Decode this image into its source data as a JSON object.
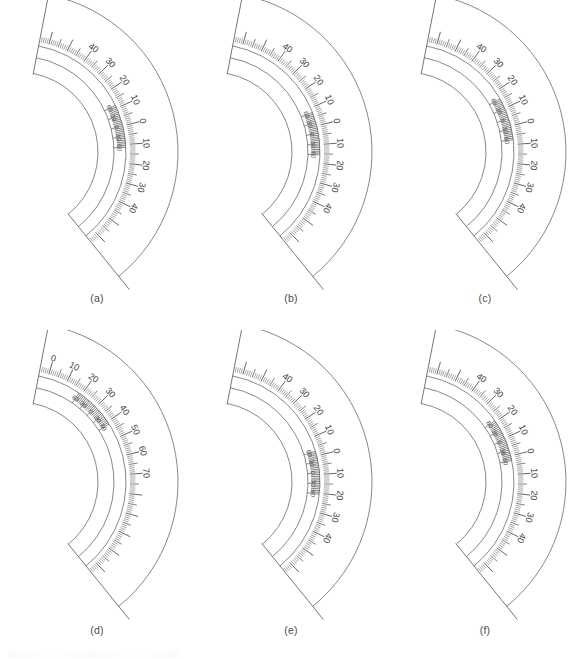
{
  "figure": {
    "background_color": "#ffffff",
    "line_color": "#5d5d5d",
    "text_color": "#3f3f3f",
    "panel_count": 6
  },
  "geometry": {
    "apex_x": 18,
    "apex_y": 152,
    "start_angle_deg": -79,
    "end_angle_deg": 51,
    "radius_inner_face": 80,
    "radius_vernier_inner": 96,
    "radius_vernier_outer": 108,
    "radius_main_scale": 112,
    "radius_outer_edge": 160,
    "tick_major_len": 13,
    "tick_mid_len": 9,
    "tick_minor_len": 5.5,
    "label_radius": 128,
    "vernier_label_radius": 101
  },
  "main_scale": {
    "unit": "degrees",
    "minor_step_deg": 1,
    "mid_step_deg": 5,
    "major_step_deg": 10
  },
  "vernier_scale": {
    "labels": [
      "60",
      "30",
      "0",
      "30",
      "60"
    ],
    "label_values": [
      60,
      30,
      0,
      30,
      60
    ],
    "unit": "minutes",
    "span_deg": 23,
    "division_count": 24
  },
  "panels": [
    {
      "id": "a",
      "caption": "(a)",
      "main_scale_labels": [
        "40",
        "30",
        "20",
        "10",
        "0",
        "10",
        "20",
        "30",
        "40"
      ],
      "main_scale_values": [
        40,
        30,
        20,
        10,
        0,
        10,
        20,
        30,
        40
      ],
      "main_scale_zero_angle_deg": -14,
      "vernier_center_angle_deg": 0.0,
      "vernier_labels": [
        "60",
        "30",
        "0",
        "30",
        "60"
      ],
      "reading_deg": 0.0
    },
    {
      "id": "b",
      "caption": "(b)",
      "main_scale_labels": [
        "40",
        "30",
        "20",
        "10",
        "0",
        "10",
        "20",
        "30",
        "40"
      ],
      "main_scale_values": [
        40,
        30,
        20,
        10,
        0,
        10,
        20,
        30,
        40
      ],
      "main_scale_zero_angle_deg": -14,
      "vernier_center_angle_deg": 4.0,
      "vernier_labels": [
        "60",
        "30",
        "0",
        "30",
        "60"
      ],
      "reading_deg": 4.0
    },
    {
      "id": "c",
      "caption": "(c)",
      "main_scale_labels": [
        "40",
        "30",
        "20",
        "10",
        "0",
        "10",
        "20",
        "30",
        "40"
      ],
      "main_scale_values": [
        40,
        30,
        20,
        10,
        0,
        10,
        20,
        30,
        40
      ],
      "main_scale_zero_angle_deg": -14,
      "vernier_center_angle_deg": -4.0,
      "vernier_labels": [
        "60",
        "30",
        "0",
        "30",
        "60"
      ],
      "reading_deg": -4.0
    },
    {
      "id": "d",
      "caption": "(d)",
      "main_scale_labels": [
        "10",
        "0",
        "10",
        "20",
        "30",
        "40",
        "50",
        "60",
        "70"
      ],
      "main_scale_values": [
        10,
        0,
        10,
        20,
        30,
        40,
        50,
        60,
        70
      ],
      "main_scale_zero_angle_deg": -44,
      "vernier_center_angle_deg": 0.0,
      "vernier_labels": [
        "60",
        "30",
        "0",
        "30",
        "60"
      ],
      "reading_deg": 30.0
    },
    {
      "id": "e",
      "caption": "(e)",
      "main_scale_labels": [
        "40",
        "30",
        "20",
        "10",
        "0",
        "10",
        "20",
        "30",
        "40"
      ],
      "main_scale_values": [
        40,
        30,
        20,
        10,
        0,
        10,
        20,
        30,
        40
      ],
      "main_scale_zero_angle_deg": -14,
      "vernier_center_angle_deg": 9.0,
      "vernier_labels": [
        "60",
        "30",
        "0",
        "30",
        "60"
      ],
      "reading_deg": 9.0
    },
    {
      "id": "f",
      "caption": "(f)",
      "main_scale_labels": [
        "40",
        "30",
        "20",
        "10",
        "0",
        "10",
        "20",
        "30",
        "40"
      ],
      "main_scale_values": [
        40,
        30,
        20,
        10,
        0,
        10,
        20,
        30,
        40
      ],
      "main_scale_zero_angle_deg": -14,
      "vernier_center_angle_deg": -9.0,
      "vernier_labels": [
        "60",
        "30",
        "0",
        "30",
        "60"
      ],
      "reading_deg": -9.0
    }
  ]
}
